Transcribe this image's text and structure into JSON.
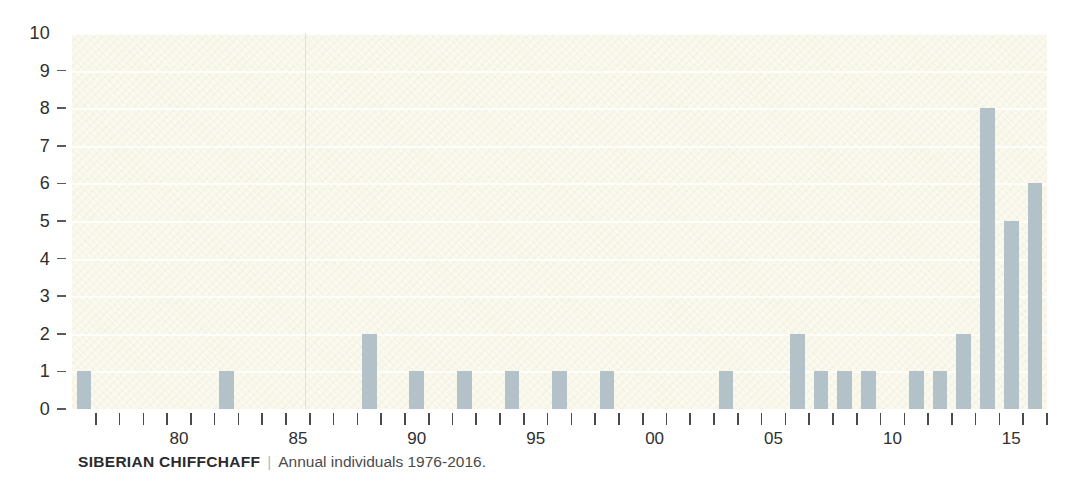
{
  "caption": {
    "title": "SIBERIAN CHIFFCHAFF",
    "separator": "|",
    "subtitle": "Annual individuals 1976-2016."
  },
  "colors": {
    "bar": "#b3c2c9",
    "plot_background": "#f8f7e9",
    "gridline": "#ffffff",
    "axis_text": "#2f2f2f",
    "page_background": "#ffffff"
  },
  "chart_data": {
    "type": "bar",
    "title": "SIBERIAN CHIFFCHAFF",
    "subtitle": "Annual individuals 1976-2016.",
    "xlabel": "",
    "ylabel": "",
    "ylim": [
      0,
      10
    ],
    "ytick_labels": [
      "10",
      "9",
      "8",
      "7",
      "6",
      "5",
      "4",
      "3",
      "2",
      "1",
      "0"
    ],
    "ytick_values": [
      10,
      9,
      8,
      7,
      6,
      5,
      4,
      3,
      2,
      1,
      0
    ],
    "grid": "horizontal",
    "legend": "none",
    "xtick_labels": [
      "80",
      "85",
      "90",
      "95",
      "00",
      "05",
      "10",
      "15"
    ],
    "xtick_label_years": [
      1980,
      1985,
      1990,
      1995,
      2000,
      2005,
      2010,
      2015
    ],
    "categories": [
      1976,
      1977,
      1978,
      1979,
      1980,
      1981,
      1982,
      1983,
      1984,
      1985,
      1986,
      1987,
      1988,
      1989,
      1990,
      1991,
      1992,
      1993,
      1994,
      1995,
      1996,
      1997,
      1998,
      1999,
      2000,
      2001,
      2002,
      2003,
      2004,
      2005,
      2006,
      2007,
      2008,
      2009,
      2010,
      2011,
      2012,
      2013,
      2014,
      2015,
      2016
    ],
    "values": [
      1,
      0,
      0,
      0,
      0,
      0,
      1,
      0,
      0,
      0,
      0,
      0,
      2,
      0,
      1,
      0,
      1,
      0,
      1,
      0,
      1,
      0,
      1,
      0,
      0,
      0,
      0,
      1,
      0,
      0,
      2,
      1,
      1,
      1,
      0,
      1,
      1,
      2,
      8,
      5,
      6
    ]
  }
}
